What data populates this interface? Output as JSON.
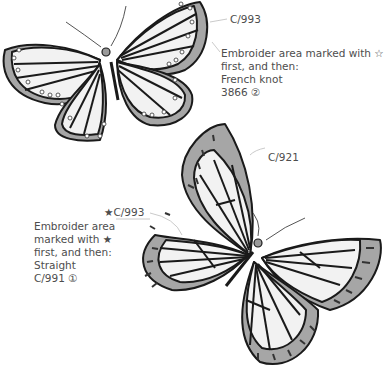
{
  "top_butterfly": {
    "color_label": "C/993",
    "note": {
      "line1": "Embroider area marked with ☆",
      "line2": "first, and then:",
      "line3": "French knot",
      "line4": "3866 ②"
    }
  },
  "bottom_butterfly": {
    "color_label": "C/921",
    "star_label": "★C/993",
    "note": {
      "line1": "Embroider area",
      "line2": "marked with ★",
      "line3": "first, and then:",
      "line4": "Straight",
      "line5": "C/991 ①"
    }
  },
  "colors": {
    "wing_fill": "#f2f2f2",
    "border_fill": "#a6a6a6",
    "outline": "#1a1a1a",
    "body_dot": "#9a9a9a",
    "leader": "#bdbdbd"
  }
}
